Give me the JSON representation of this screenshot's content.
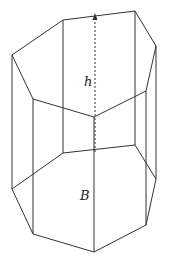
{
  "diagram": {
    "type": "heptagonal prism",
    "labels": {
      "height": "h",
      "base": "B"
    },
    "colors": {
      "line": "#333333",
      "background": "#ffffff"
    },
    "top_face": [
      [
        12,
        55
      ],
      [
        63,
        20
      ],
      [
        135,
        11
      ],
      [
        156,
        46
      ],
      [
        146,
        91
      ],
      [
        94,
        117
      ],
      [
        33,
        99
      ]
    ],
    "bottom_face": [
      [
        12,
        189
      ],
      [
        63,
        153
      ],
      [
        135,
        145
      ],
      [
        156,
        179
      ],
      [
        146,
        225
      ],
      [
        94,
        252
      ],
      [
        33,
        234
      ]
    ],
    "hidden_edges_visible": true,
    "height_line": {
      "from": [
        95,
        252
      ],
      "to": [
        95,
        15
      ],
      "style": "dashed",
      "arrow": "up"
    }
  }
}
